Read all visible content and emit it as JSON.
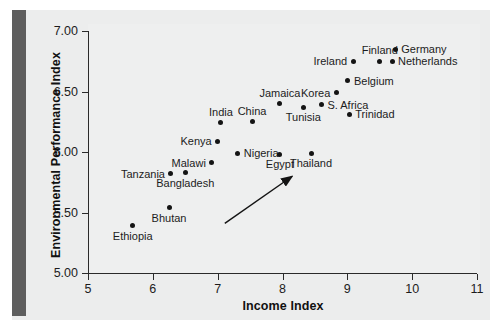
{
  "chart_data": {
    "type": "scatter",
    "title": "",
    "xlabel": "Income Index",
    "ylabel": "Environmental Performance Index",
    "xlim": [
      5,
      11
    ],
    "ylim": [
      5.0,
      7.0
    ],
    "xticks": [
      "5",
      "6",
      "7",
      "8",
      "9",
      "10",
      "11"
    ],
    "yticks": [
      "5.00",
      "5.50",
      "6.00",
      "6.50",
      "7.00"
    ],
    "grid": false,
    "legend": null,
    "annotations": [
      {
        "name": "positive-trend-arrow",
        "type": "arrow",
        "from": [
          7.11,
          5.41
        ],
        "to": [
          8.15,
          5.8
        ]
      }
    ],
    "points": [
      {
        "label": "Ethiopia",
        "x": 5.69,
        "y": 5.39,
        "label_pos": "below"
      },
      {
        "label": "Bhutan",
        "x": 6.25,
        "y": 5.54,
        "label_pos": "below"
      },
      {
        "label": "Tanzania",
        "x": 6.28,
        "y": 5.82,
        "label_pos": "left"
      },
      {
        "label": "Bangladesh",
        "x": 6.5,
        "y": 5.83,
        "label_pos": "below"
      },
      {
        "label": "Malawi",
        "x": 6.91,
        "y": 5.91,
        "label_pos": "left"
      },
      {
        "label": "Kenya",
        "x": 7.0,
        "y": 6.09,
        "label_pos": "left"
      },
      {
        "label": "India",
        "x": 7.05,
        "y": 6.24,
        "label_pos": "above"
      },
      {
        "label": "Nigeria",
        "x": 7.31,
        "y": 5.99,
        "label_pos": "right"
      },
      {
        "label": "China",
        "x": 7.53,
        "y": 6.25,
        "label_pos": "above"
      },
      {
        "label": "Egypt",
        "x": 7.96,
        "y": 5.98,
        "label_pos": "below"
      },
      {
        "label": "Jamaica",
        "x": 7.96,
        "y": 6.4,
        "label_pos": "above"
      },
      {
        "label": "Tunisia",
        "x": 8.32,
        "y": 6.37,
        "label_pos": "below"
      },
      {
        "label": "Thailand",
        "x": 8.44,
        "y": 5.99,
        "label_pos": "below"
      },
      {
        "label": "S. Africa",
        "x": 8.6,
        "y": 6.39,
        "label_pos": "right"
      },
      {
        "label": "Korea",
        "x": 8.83,
        "y": 6.49,
        "label_pos": "left"
      },
      {
        "label": "Trinidad",
        "x": 9.03,
        "y": 6.31,
        "label_pos": "right"
      },
      {
        "label": "Belgium",
        "x": 9.01,
        "y": 6.59,
        "label_pos": "right"
      },
      {
        "label": "Ireland",
        "x": 9.09,
        "y": 6.75,
        "label_pos": "left"
      },
      {
        "label": "Finland",
        "x": 9.5,
        "y": 6.75,
        "label_pos": "above"
      },
      {
        "label": "Netherlands",
        "x": 9.69,
        "y": 6.75,
        "label_pos": "right"
      },
      {
        "label": "Germany",
        "x": 9.74,
        "y": 6.85,
        "label_pos": "right"
      }
    ]
  },
  "colors": {
    "point": "#141414",
    "axis": "#2a2a2a",
    "panel": "#eceded",
    "spine": "#5e5e5e",
    "text": "#1c1c1c"
  }
}
